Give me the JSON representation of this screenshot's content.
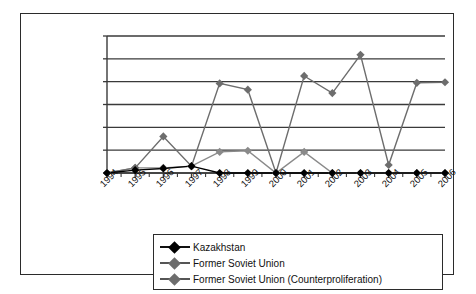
{
  "chart_data": {
    "type": "line",
    "title": "",
    "xlabel": "",
    "ylabel": "",
    "categories": [
      "1994",
      "1995",
      "1996",
      "1997",
      "1998",
      "1999",
      "2000",
      "2001",
      "2002",
      "2003",
      "2004",
      "2005",
      "2006"
    ],
    "ylim": [
      0,
      12000000
    ],
    "ytick_values": [
      0,
      2000000,
      4000000,
      6000000,
      8000000,
      10000000,
      12000000
    ],
    "ytick_labels": [
      "$0",
      "$2,000,000",
      "$4,000,000",
      "$6,000,000",
      "$8,000,000",
      "$10,000,000",
      "$12,000,000"
    ],
    "grid": true,
    "legend_position": "bottom",
    "series": [
      {
        "name": "Kazakhstan",
        "color": "#000000",
        "marker": "diamond",
        "values": [
          0,
          250000,
          400000,
          600000,
          0,
          0,
          0,
          0,
          0,
          0,
          0,
          0,
          0
        ]
      },
      {
        "name": "Former Soviet Union",
        "color": "#6d6d6d",
        "marker": "diamond",
        "values": [
          0,
          450000,
          3200000,
          600000,
          7850000,
          7300000,
          0,
          8500000,
          7000000,
          10350000,
          700000,
          7900000,
          7950000
        ]
      },
      {
        "name": "Former Soviet Union (Counterproliferation)",
        "color": "#8a8a8a",
        "marker": "diamond",
        "values": [
          0,
          450000,
          450000,
          600000,
          1850000,
          1950000,
          0,
          1850000,
          0,
          0,
          0,
          0,
          0
        ]
      }
    ]
  },
  "legend": {
    "items": [
      {
        "label": "Kazakhstan"
      },
      {
        "label": "Former Soviet Union"
      },
      {
        "label": "Former Soviet Union (Counterproliferation)"
      }
    ]
  },
  "colors": {
    "frame": "#2b2b2b",
    "gridline": "#3a3a3a",
    "series_dark": "#000000",
    "series_gray": "#6d6d6d",
    "background": "#ffffff"
  }
}
